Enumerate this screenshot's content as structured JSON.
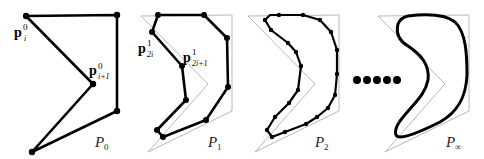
{
  "figure": {
    "colors": {
      "polygon": "#000000",
      "control_outline": "#b8b8b8",
      "background": "#ffffff"
    },
    "panels": [
      {
        "id": "P0",
        "label_main": "P",
        "label_sub": "0",
        "point_labels": [
          {
            "main": "p",
            "sup": "0",
            "sub": "i"
          },
          {
            "main": "p",
            "sup": "0",
            "sub": "i+1"
          }
        ]
      },
      {
        "id": "P1",
        "label_main": "P",
        "label_sub": "1",
        "point_labels": [
          {
            "main": "p",
            "sup": "1",
            "sub": "2i"
          },
          {
            "main": "p",
            "sup": "1",
            "sub": "2i+1"
          }
        ]
      },
      {
        "id": "P2",
        "label_main": "P",
        "label_sub": "2"
      },
      {
        "id": "Pinf",
        "label_main": "P",
        "label_sub": "∞"
      }
    ],
    "ellipsis": "•••••"
  }
}
